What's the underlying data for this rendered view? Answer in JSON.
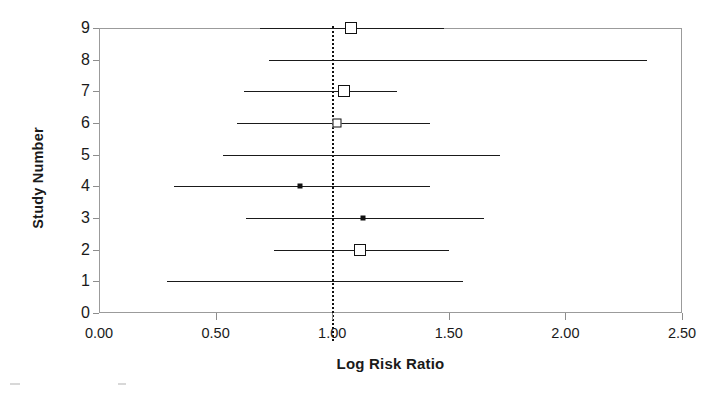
{
  "chart_data": {
    "type": "scatter",
    "subtype": "forest-plot",
    "title": "",
    "xlabel": "Log Risk Ratio",
    "ylabel": "Study Number",
    "xlim": [
      0.0,
      2.5
    ],
    "ylim": [
      0,
      9
    ],
    "xticks": [
      "0.00",
      "0.50",
      "1.00",
      "1.50",
      "2.00",
      "2.50"
    ],
    "xtick_values": [
      0.0,
      0.5,
      1.0,
      1.5,
      2.0,
      2.5
    ],
    "yticks": [
      "0",
      "1",
      "2",
      "3",
      "4",
      "5",
      "6",
      "7",
      "8",
      "9"
    ],
    "ytick_values": [
      0,
      1,
      2,
      3,
      4,
      5,
      6,
      7,
      8,
      9
    ],
    "grid": false,
    "legend": "none",
    "reference_line": {
      "value": 1.0,
      "style": "dotted",
      "orientation": "vertical",
      "color": "#111111"
    },
    "categories": [
      9,
      8,
      7,
      6,
      5,
      4,
      3,
      2,
      1
    ],
    "series": [
      {
        "name": "Risk ratio with 95% CI",
        "points": [
          {
            "study": 9,
            "estimate": 1.08,
            "ci_low": 0.69,
            "ci_high": 1.48,
            "marker": "square-lg"
          },
          {
            "study": 8,
            "estimate": null,
            "ci_low": 0.73,
            "ci_high": 2.35,
            "marker": "none"
          },
          {
            "study": 7,
            "estimate": 1.05,
            "ci_low": 0.62,
            "ci_high": 1.28,
            "marker": "square-lg"
          },
          {
            "study": 6,
            "estimate": 1.02,
            "ci_low": 0.59,
            "ci_high": 1.42,
            "marker": "square-sm"
          },
          {
            "study": 5,
            "estimate": null,
            "ci_low": 0.53,
            "ci_high": 1.72,
            "marker": "none"
          },
          {
            "study": 4,
            "estimate": 0.86,
            "ci_low": 0.32,
            "ci_high": 1.42,
            "marker": "dot"
          },
          {
            "study": 3,
            "estimate": 1.13,
            "ci_low": 0.63,
            "ci_high": 1.65,
            "marker": "dot"
          },
          {
            "study": 2,
            "estimate": 1.12,
            "ci_low": 0.75,
            "ci_high": 1.5,
            "marker": "square-lg"
          },
          {
            "study": 1,
            "estimate": null,
            "ci_low": 0.29,
            "ci_high": 1.56,
            "marker": "none"
          }
        ]
      }
    ],
    "colors": {
      "line": "#1a1a1a",
      "marker_edge": "#111111",
      "marker_fill": "#ffffff",
      "axis": "#9b9b9b",
      "text": "#1a1a1a"
    }
  }
}
